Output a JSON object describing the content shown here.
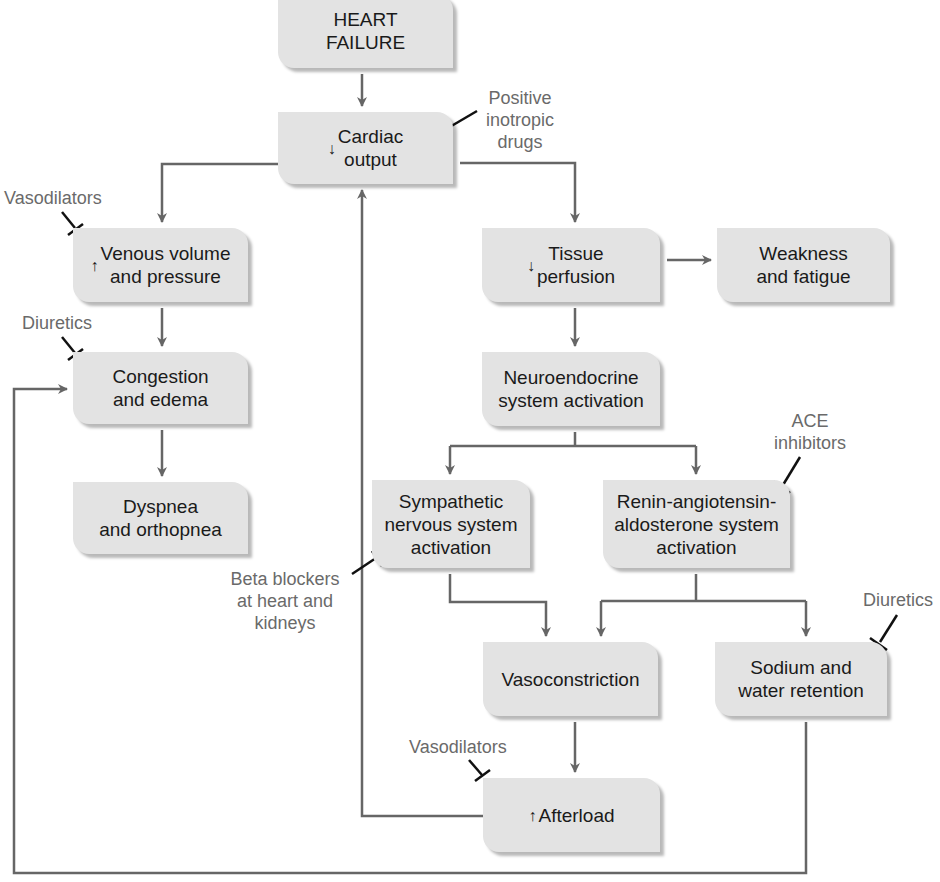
{
  "diagram": {
    "colors": {
      "box_fill": "#e3e3e3",
      "line": "#666666",
      "blocker": "#111111",
      "drug_label": "#6a6a6a"
    },
    "nodes": {
      "heart_failure": {
        "text": "HEART\nFAILURE",
        "arrow": ""
      },
      "cardiac_output": {
        "text": "Cardiac\noutput",
        "arrow": "↓"
      },
      "venous": {
        "text": "Venous volume\nand pressure",
        "arrow": "↑"
      },
      "tissue": {
        "text": "Tissue\nperfusion",
        "arrow": "↓"
      },
      "weakness": {
        "text": "Weakness\nand fatigue",
        "arrow": ""
      },
      "congestion": {
        "text": "Congestion\nand edema",
        "arrow": ""
      },
      "neuroendocrine": {
        "text": "Neuroendocrine\nsystem activation",
        "arrow": ""
      },
      "dyspnea": {
        "text": "Dyspnea\nand orthopnea",
        "arrow": ""
      },
      "sympathetic": {
        "text": "Sympathetic\nnervous system\nactivation",
        "arrow": ""
      },
      "raas": {
        "text": "Renin-angiotensin-\naldosterone system\nactivation",
        "arrow": ""
      },
      "vasoconstriction": {
        "text": "Vasoconstriction",
        "arrow": ""
      },
      "sodium": {
        "text": "Sodium and\nwater retention",
        "arrow": ""
      },
      "afterload": {
        "text": "Afterload",
        "arrow": "↑"
      }
    },
    "drugs": {
      "inotropic": "Positive\ninotropic\ndrugs",
      "vasodilators_venous": "Vasodilators",
      "diuretics_congestion": "Diuretics",
      "ace": "ACE\ninhibitors",
      "beta": "Beta blockers\nat heart and\nkidneys",
      "diuretics_sodium": "Diuretics",
      "vasodilators_afterload": "Vasodilators"
    }
  }
}
